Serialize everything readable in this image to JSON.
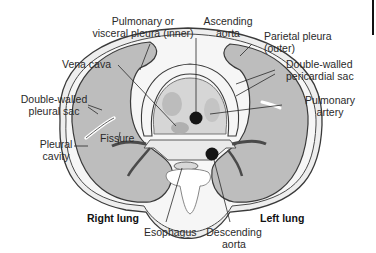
{
  "diagram": {
    "type": "anatomical cross-section of thorax",
    "labels": {
      "pulmonary_pleura": [
        "Pulmonary or",
        "visceral pleura (inner)"
      ],
      "ascending_aorta": [
        "Ascending",
        "aorta"
      ],
      "parietal_pleura": [
        "Parietal pleura",
        "(outer)"
      ],
      "vena_cava": "Vena cava",
      "pericardial_sac": [
        "Double-walled",
        "pericardial sac"
      ],
      "pleural_sac": [
        "Double-walled",
        "pleural sac"
      ],
      "pulmonary_artery": [
        "Pulmonary",
        "artery"
      ],
      "fissure": "Fissure",
      "pleural_cavity": [
        "Pleural",
        "cavity"
      ],
      "right_lung": "Right lung",
      "left_lung": "Left lung",
      "esophagus": "Esophagus",
      "descending_aorta": [
        "Descending",
        "aorta"
      ]
    },
    "colors": {
      "lung_fill": "#bdbdbd",
      "outline": "#3a3a3a",
      "pleura_band": "#ececec",
      "vessel_dark": "#151515",
      "mediastinum": "#f2f2f2",
      "heart_fill": "#d4d4d4"
    }
  }
}
